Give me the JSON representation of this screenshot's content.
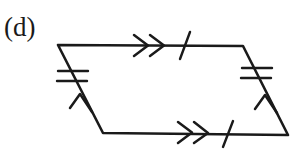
{
  "figure": {
    "label": "(d)",
    "type": "parallelogram-congruence-diagram",
    "background_color": "#ffffff",
    "stroke_color": "#1a1a1a",
    "canvas": {
      "width": 306,
      "height": 161
    }
  },
  "shape": {
    "name": "parallelogram",
    "vertices": [
      {
        "name": "top-left",
        "x": 58,
        "y": 45
      },
      {
        "name": "top-right",
        "x": 243,
        "y": 46
      },
      {
        "name": "bottom-right",
        "x": 288,
        "y": 135
      },
      {
        "name": "bottom-left",
        "x": 103,
        "y": 133
      }
    ],
    "stroke_width": 2.6
  },
  "edges": [
    {
      "name": "top-edge",
      "from": "top-left",
      "to": "top-right",
      "arrow_marks": 2,
      "arrow_direction": "right",
      "tick_marks": 1,
      "tick_style": "slanted",
      "arrow_center_x": 148,
      "tick_center_x": 185
    },
    {
      "name": "bottom-edge",
      "from": "bottom-left",
      "to": "bottom-right",
      "arrow_marks": 2,
      "arrow_direction": "right",
      "tick_marks": 1,
      "tick_style": "slanted",
      "arrow_center_x": 192,
      "tick_center_x": 228
    },
    {
      "name": "left-edge",
      "from": "bottom-left",
      "to": "top-left",
      "arrow_marks": 1,
      "arrow_direction": "up-left",
      "tick_marks": 2,
      "tick_style": "horizontal",
      "arrow_center": {
        "x": 83,
        "y": 100
      },
      "tick_center": {
        "x": 73,
        "y": 76
      }
    },
    {
      "name": "right-edge",
      "from": "bottom-right",
      "to": "top-right",
      "arrow_marks": 1,
      "arrow_direction": "up-left",
      "tick_marks": 2,
      "tick_style": "horizontal",
      "arrow_center": {
        "x": 268,
        "y": 101
      },
      "tick_center": {
        "x": 257,
        "y": 73
      }
    }
  ]
}
